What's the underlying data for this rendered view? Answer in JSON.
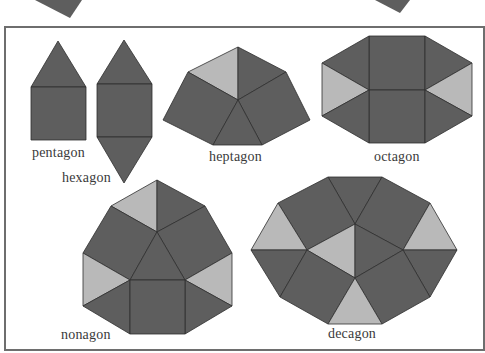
{
  "colors": {
    "dark": "#5e5e5e",
    "light": "#b9b9b9",
    "edge": "#2e2e2e",
    "frame": "#6e6e6e",
    "text": "#3a3a3a"
  },
  "figure": {
    "shapes": [
      {
        "name": "pentagon",
        "label": "pentagon",
        "net": "1 square + 1 triangle"
      },
      {
        "name": "hexagon",
        "label": "hexagon",
        "net": "1 square + 2 triangles"
      },
      {
        "name": "heptagon",
        "label": "heptagon",
        "net": "2 squares + 3 triangles (1 light)"
      },
      {
        "name": "octagon",
        "label": "octagon",
        "net": "2 squares + 6 triangles (2 light)"
      },
      {
        "name": "nonagon",
        "label": "nonagon",
        "net": "3 squares + 7 triangles (3 light)"
      },
      {
        "name": "decagon",
        "label": "decagon",
        "net": "4 squares + 8 triangles (4 light)"
      }
    ]
  }
}
